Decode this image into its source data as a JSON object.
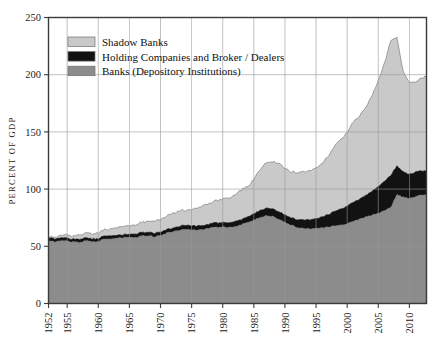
{
  "chart": {
    "type": "area",
    "ylabel": "PERCENT OF GDP",
    "xlabel": "",
    "title": "",
    "grid": true,
    "legend_position": "top-left",
    "ylim": [
      0,
      250
    ],
    "xlim": [
      1952,
      2012.75
    ],
    "yticks": [
      "0",
      "50",
      "100",
      "150",
      "200",
      "250"
    ],
    "xticks": [
      "1952",
      "1955",
      "1960",
      "1965",
      "1970",
      "1975",
      "1980",
      "1985",
      "1990",
      "1995",
      "2000",
      "2005",
      "2010"
    ]
  },
  "legend": {
    "items": [
      {
        "label": "Shadow Banks",
        "color": "#c9c9c9"
      },
      {
        "label": "Holding Companies and Broker / Dealers",
        "color": "#121212"
      },
      {
        "label": "Banks (Depository Institutions)",
        "color": "#8c8c8c"
      }
    ]
  },
  "colors": {
    "shadow_banks": "#c9c9c9",
    "holding_companies": "#121212",
    "banks": "#8c8c8c",
    "axis": "#3b3b3b",
    "grid": "#9a9a9a",
    "background": "#ffffff"
  },
  "chart_data": {
    "type": "area",
    "stacked": true,
    "title": "",
    "xlabel": "",
    "ylabel": "PERCENT OF GDP",
    "ylim": [
      0,
      250
    ],
    "xlim": [
      1952,
      2012.75
    ],
    "yticks": [
      0,
      50,
      100,
      150,
      200,
      250
    ],
    "xticks": [
      1952,
      1955,
      1960,
      1965,
      1970,
      1975,
      1980,
      1985,
      1990,
      1995,
      2000,
      2005,
      2010
    ],
    "grid": true,
    "legend_position": "top-left",
    "stack_order_bottom_to_top": [
      "Banks (Depository Institutions)",
      "Holding Companies and Broker / Dealers",
      "Shadow Banks"
    ],
    "x": [
      1952,
      1953,
      1954,
      1955,
      1956,
      1957,
      1958,
      1959,
      1960,
      1961,
      1962,
      1963,
      1964,
      1965,
      1966,
      1967,
      1968,
      1969,
      1970,
      1971,
      1972,
      1973,
      1974,
      1975,
      1976,
      1977,
      1978,
      1979,
      1980,
      1981,
      1982,
      1983,
      1984,
      1985,
      1986,
      1987,
      1988,
      1989,
      1990,
      1991,
      1992,
      1993,
      1994,
      1995,
      1996,
      1997,
      1998,
      1999,
      2000,
      2001,
      2002,
      2003,
      2004,
      2005,
      2006,
      2007,
      2008,
      2009,
      2010,
      2011,
      2012
    ],
    "series": [
      {
        "name": "Banks (Depository Institutions)",
        "color": "#8c8c8c",
        "values": [
          54.5,
          54.0,
          55.0,
          54.5,
          54.0,
          53.5,
          55.0,
          54.0,
          54.5,
          56.0,
          56.5,
          57.0,
          57.5,
          58.0,
          57.5,
          59.0,
          59.5,
          58.5,
          59.5,
          61.5,
          63.0,
          64.0,
          65.0,
          64.5,
          64.0,
          65.0,
          66.0,
          66.5,
          67.0,
          66.5,
          67.5,
          69.0,
          71.0,
          73.0,
          75.0,
          77.0,
          76.0,
          74.0,
          71.0,
          68.5,
          66.5,
          65.5,
          65.5,
          66.0,
          66.5,
          67.0,
          68.0,
          68.5,
          69.5,
          72.0,
          74.0,
          75.5,
          77.5,
          79.0,
          81.0,
          84.0,
          95.0,
          93.0,
          92.0,
          93.0,
          95.0
        ]
      },
      {
        "name": "Holding Companies and Broker / Dealers",
        "color": "#121212",
        "values": [
          2.5,
          2.5,
          2.5,
          2.5,
          2.5,
          2.5,
          2.5,
          2.5,
          2.5,
          2.5,
          2.5,
          2.5,
          2.5,
          2.5,
          3.0,
          3.0,
          3.0,
          3.0,
          3.0,
          3.0,
          3.0,
          3.5,
          3.5,
          3.5,
          3.5,
          3.5,
          3.5,
          4.0,
          4.0,
          4.0,
          4.5,
          4.5,
          5.0,
          5.5,
          6.0,
          6.5,
          6.5,
          6.5,
          6.5,
          6.5,
          7.0,
          7.5,
          8.0,
          8.5,
          9.5,
          11.0,
          12.5,
          14.0,
          15.5,
          16.5,
          17.5,
          19.0,
          21.0,
          23.0,
          25.5,
          28.0,
          25.0,
          22.0,
          21.0,
          21.5,
          21.0
        ]
      },
      {
        "name": "Shadow Banks",
        "color": "#c9c9c9",
        "values": [
          1.0,
          1.5,
          2.0,
          2.5,
          3.0,
          3.5,
          4.0,
          4.5,
          5.0,
          5.5,
          6.0,
          6.5,
          7.0,
          7.5,
          8.0,
          9.0,
          10.0,
          10.5,
          11.0,
          12.0,
          13.0,
          13.5,
          13.0,
          14.5,
          16.0,
          17.5,
          18.5,
          19.5,
          21.0,
          22.0,
          23.5,
          25.5,
          27.0,
          30.0,
          36.0,
          40.0,
          41.0,
          43.0,
          41.0,
          40.0,
          40.5,
          42.0,
          43.0,
          44.5,
          47.0,
          51.0,
          57.0,
          61.0,
          65.0,
          70.0,
          73.0,
          77.0,
          84.0,
          92.0,
          103.0,
          118.0,
          112.0,
          88.0,
          80.0,
          79.0,
          82.0
        ]
      }
    ],
    "totals": [
      58.0,
      58.0,
      59.5,
      59.5,
      59.5,
      59.5,
      61.5,
      61.0,
      62.0,
      64.0,
      65.0,
      66.0,
      67.0,
      68.0,
      68.5,
      71.0,
      72.5,
      72.0,
      73.5,
      76.5,
      79.0,
      81.0,
      81.5,
      82.5,
      83.5,
      86.0,
      88.0,
      90.0,
      92.0,
      92.5,
      95.5,
      99.0,
      103.0,
      108.5,
      117.0,
      123.5,
      123.5,
      123.5,
      118.5,
      115.0,
      114.0,
      115.0,
      116.5,
      119.0,
      123.0,
      129.0,
      137.5,
      143.5,
      150.0,
      158.5,
      164.5,
      171.5,
      182.5,
      194.0,
      209.5,
      230.0,
      232.0,
      203.0,
      193.0,
      193.5,
      198.0
    ],
    "annotations": [
      {
        "text": "peak total",
        "x": 2008,
        "y": 232
      }
    ]
  }
}
